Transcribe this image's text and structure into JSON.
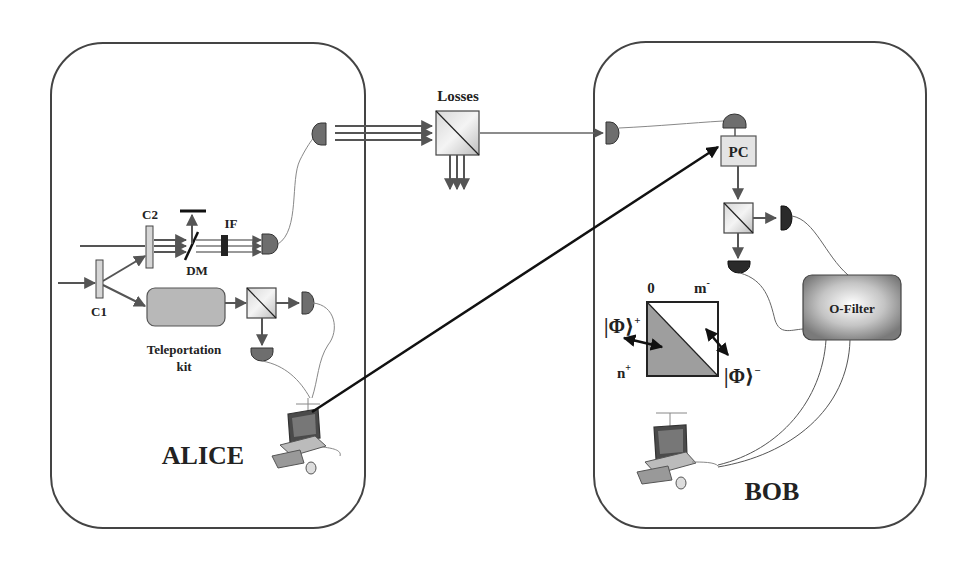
{
  "diagram": {
    "parties": {
      "alice": {
        "label": "ALICE"
      },
      "bob": {
        "label": "BOB"
      }
    },
    "channel": {
      "losses_label": "Losses"
    },
    "alice_components": {
      "c1": "C1",
      "c2": "C2",
      "dm": "DM",
      "if": "IF",
      "teleportation_kit_line1": "Teleportation",
      "teleportation_kit_line2": "kit"
    },
    "bob_components": {
      "pc": "PC",
      "o_filter": "O-Filter",
      "square_top_left": "0",
      "square_top_right": "m",
      "square_top_right_sup": "-",
      "square_bottom_left": "n",
      "square_bottom_left_sup": "+",
      "phi_plus": "|Φ⟩",
      "phi_plus_sup": "+",
      "phi_minus": "|Φ⟩",
      "phi_minus_sup": "−"
    },
    "colors": {
      "outline": "#333333",
      "beam": "#5a5a5a",
      "detector": "#6e6e6e",
      "detector_dark": "#2a2a2a",
      "box_fill": "#b8b8b8",
      "classical_link": "#111111",
      "fiber": "#777777"
    }
  }
}
